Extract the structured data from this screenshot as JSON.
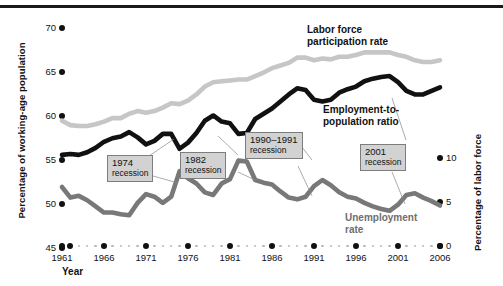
{
  "figure": {
    "x_axis_title": "Year",
    "y_left_title": "Percentage of working-age population",
    "y_right_title": "Percentage of labor force"
  },
  "series_labels": {
    "lfpr_line1": "Labor force",
    "lfpr_line2": "participation rate",
    "epop_line1": "Employment-to-",
    "epop_line2": "population ratio",
    "unemp_line1": "Unemployment",
    "unemp_line2": "rate"
  },
  "callouts": [
    {
      "year": "1974",
      "word": "recession"
    },
    {
      "year": "1982",
      "word": "recession"
    },
    {
      "year": "1990–1991",
      "word": "recession"
    },
    {
      "year": "2001",
      "word": "recession"
    }
  ],
  "colors": {
    "lfpr": "#c6c6c6",
    "epop": "#111111",
    "unemployment": "#787878",
    "callout_fill": "#d2d2d2",
    "callout_border": "#7d7d7d",
    "baseline_dots": "#b9b9b9",
    "top_rule": "#1a1a1a"
  },
  "chart_data": {
    "type": "line",
    "title": "",
    "xlabel": "Year",
    "ylabel": "Percentage of working-age population",
    "ylabel_right": "Percentage of labor force",
    "xlim": [
      1961,
      2006
    ],
    "ylim": [
      45,
      70
    ],
    "ylim_right": [
      0,
      10
    ],
    "grid": false,
    "legend": "inline-annotations",
    "x_ticks": [
      1961,
      1966,
      1971,
      1976,
      1981,
      1986,
      1991,
      1996,
      2001,
      2006
    ],
    "y_ticks_left": [
      45,
      50,
      55,
      60,
      65,
      70
    ],
    "y_ticks_right": [
      0,
      5,
      10
    ],
    "x": [
      1961,
      1962,
      1963,
      1964,
      1965,
      1966,
      1967,
      1968,
      1969,
      1970,
      1971,
      1972,
      1973,
      1974,
      1975,
      1976,
      1977,
      1978,
      1979,
      1980,
      1981,
      1982,
      1983,
      1984,
      1985,
      1986,
      1987,
      1988,
      1989,
      1990,
      1991,
      1992,
      1993,
      1994,
      1995,
      1996,
      1997,
      1998,
      1999,
      2000,
      2001,
      2002,
      2003,
      2004,
      2005,
      2006
    ],
    "series": [
      {
        "name": "Labor force participation rate",
        "axis": "left",
        "color": "#c6c6c6",
        "values": [
          59.3,
          58.8,
          58.7,
          58.7,
          58.9,
          59.2,
          59.6,
          59.6,
          60.1,
          60.4,
          60.2,
          60.4,
          60.8,
          61.3,
          61.2,
          61.6,
          62.3,
          63.2,
          63.7,
          63.8,
          63.9,
          64.0,
          64.0,
          64.4,
          64.8,
          65.3,
          65.6,
          65.9,
          66.5,
          66.5,
          66.2,
          66.4,
          66.3,
          66.6,
          66.6,
          66.8,
          67.1,
          67.1,
          67.1,
          67.1,
          66.8,
          66.6,
          66.2,
          66.0,
          66.0,
          66.2
        ]
      },
      {
        "name": "Employment-to-population ratio",
        "axis": "left",
        "color": "#111111",
        "values": [
          55.4,
          55.5,
          55.4,
          55.7,
          56.2,
          56.9,
          57.3,
          57.5,
          58.0,
          57.4,
          56.6,
          57.0,
          57.8,
          57.8,
          56.1,
          56.8,
          57.9,
          59.3,
          59.9,
          59.2,
          59.0,
          57.8,
          57.9,
          59.5,
          60.1,
          60.7,
          61.5,
          62.3,
          63.0,
          62.8,
          61.7,
          61.5,
          61.7,
          62.5,
          62.9,
          63.2,
          63.8,
          64.1,
          64.3,
          64.4,
          63.7,
          62.7,
          62.3,
          62.3,
          62.7,
          63.1
        ]
      },
      {
        "name": "Unemployment rate",
        "axis": "right",
        "color": "#787878",
        "values": [
          6.7,
          5.5,
          5.7,
          5.2,
          4.5,
          3.8,
          3.8,
          3.6,
          3.5,
          4.9,
          5.9,
          5.6,
          4.9,
          5.6,
          8.5,
          7.7,
          7.1,
          6.1,
          5.8,
          7.1,
          7.6,
          9.7,
          9.6,
          7.5,
          7.2,
          7.0,
          6.2,
          5.5,
          5.3,
          5.6,
          6.8,
          7.5,
          6.9,
          6.1,
          5.6,
          5.4,
          4.9,
          4.5,
          4.2,
          4.0,
          4.7,
          5.8,
          6.0,
          5.5,
          5.1,
          4.6
        ]
      }
    ],
    "annotations": [
      {
        "text": "1974 recession",
        "type": "callout-box"
      },
      {
        "text": "1982 recession",
        "type": "callout-box"
      },
      {
        "text": "1990–1991 recession",
        "type": "callout-box"
      },
      {
        "text": "2001 recession",
        "type": "callout-box"
      }
    ]
  }
}
